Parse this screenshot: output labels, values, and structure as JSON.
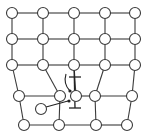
{
  "diagram": {
    "title": "",
    "colors": {
      "line": "#3a3a3a",
      "atom_fill": "#ffffff",
      "symbol": "#222222"
    },
    "atom_radius": 5.5,
    "atoms": [
      {
        "id": "a00",
        "x": 12,
        "y": 13
      },
      {
        "id": "a01",
        "x": 43,
        "y": 13
      },
      {
        "id": "a02",
        "x": 74,
        "y": 13
      },
      {
        "id": "a03",
        "x": 105,
        "y": 13
      },
      {
        "id": "a04",
        "x": 135,
        "y": 13
      },
      {
        "id": "a10",
        "x": 12,
        "y": 39
      },
      {
        "id": "a11",
        "x": 43,
        "y": 39
      },
      {
        "id": "a12",
        "x": 74,
        "y": 39
      },
      {
        "id": "a13",
        "x": 105,
        "y": 39
      },
      {
        "id": "a14",
        "x": 135,
        "y": 39
      },
      {
        "id": "a20",
        "x": 12,
        "y": 65
      },
      {
        "id": "a21",
        "x": 43,
        "y": 65
      },
      {
        "id": "a22",
        "x": 74,
        "y": 65
      },
      {
        "id": "a23",
        "x": 105,
        "y": 65
      },
      {
        "id": "a24",
        "x": 135,
        "y": 65
      },
      {
        "id": "a30",
        "x": 19,
        "y": 96
      },
      {
        "id": "a31",
        "x": 60,
        "y": 96
      },
      {
        "id": "a32",
        "x": 76,
        "y": 96
      },
      {
        "id": "a33",
        "x": 95,
        "y": 96
      },
      {
        "id": "a34",
        "x": 132,
        "y": 96
      },
      {
        "id": "a40",
        "x": 24,
        "y": 125
      },
      {
        "id": "a41",
        "x": 59,
        "y": 125
      },
      {
        "id": "a42",
        "x": 96,
        "y": 125
      },
      {
        "id": "a43",
        "x": 127,
        "y": 125
      },
      {
        "id": "interstitial",
        "x": 41,
        "y": 109
      }
    ],
    "bonds": [
      [
        "a00",
        "a01"
      ],
      [
        "a01",
        "a02"
      ],
      [
        "a02",
        "a03"
      ],
      [
        "a03",
        "a04"
      ],
      [
        "a10",
        "a11"
      ],
      [
        "a11",
        "a12"
      ],
      [
        "a12",
        "a13"
      ],
      [
        "a13",
        "a14"
      ],
      [
        "a20",
        "a21"
      ],
      [
        "a21",
        "a22"
      ],
      [
        "a22",
        "a23"
      ],
      [
        "a23",
        "a24"
      ],
      [
        "a30",
        "a31"
      ],
      [
        "a32",
        "a33"
      ],
      [
        "a33",
        "a34"
      ],
      [
        "a40",
        "a41"
      ],
      [
        "a41",
        "a42"
      ],
      [
        "a42",
        "a43"
      ],
      [
        "a00",
        "a10"
      ],
      [
        "a10",
        "a20"
      ],
      [
        "a20",
        "a30"
      ],
      [
        "a30",
        "a40"
      ],
      [
        "a01",
        "a11"
      ],
      [
        "a11",
        "a21"
      ],
      [
        "a21",
        "a31"
      ],
      [
        "a31",
        "a41"
      ],
      [
        "a02",
        "a12"
      ],
      [
        "a12",
        "a22"
      ],
      [
        "a22",
        "a32"
      ],
      [
        "a03",
        "a13"
      ],
      [
        "a13",
        "a23"
      ],
      [
        "a23",
        "a33"
      ],
      [
        "a33",
        "a42"
      ],
      [
        "a04",
        "a14"
      ],
      [
        "a14",
        "a24"
      ],
      [
        "a24",
        "a34"
      ],
      [
        "a34",
        "a43"
      ]
    ],
    "dislocation_symbols": [
      {
        "name": "upper-dislocation-symbol",
        "x": 75,
        "y": 77,
        "half_width": 6
      },
      {
        "name": "lower-dislocation-symbol",
        "x": 75,
        "y": 108,
        "half_width": 6
      }
    ],
    "arrows": [
      {
        "name": "curved-arrow",
        "path": "M66 74 Q63 84 70 91",
        "head": [
          70,
          91
        ]
      },
      {
        "name": "straight-arrow",
        "path": "M46 107 L68 101",
        "head": [
          69,
          101
        ]
      }
    ]
  }
}
